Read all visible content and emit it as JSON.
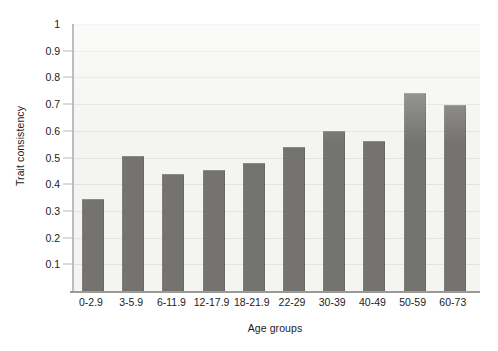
{
  "chart_data": {
    "type": "bar",
    "title": "",
    "xlabel": "Age groups",
    "ylabel": "Trait consistency",
    "categories": [
      "0-2.9",
      "3-5.9",
      "6-11.9",
      "12-17.9",
      "18-21.9",
      "22-29",
      "30-39",
      "40-49",
      "50-59",
      "60-73"
    ],
    "values": [
      0.345,
      0.505,
      0.44,
      0.455,
      0.48,
      0.54,
      0.6,
      0.56,
      0.74,
      0.695
    ],
    "ylim": [
      0,
      1
    ],
    "ytick_labels": [
      "0.1",
      "0.2",
      "0.3",
      "0.4",
      "0.5",
      "0.6",
      "0.7",
      "0.8",
      "0.9",
      "1"
    ],
    "ytick_values": [
      0.1,
      0.2,
      0.3,
      0.4,
      0.5,
      0.6,
      0.7,
      0.8,
      0.9,
      1
    ],
    "grid": true,
    "legend": null,
    "legend_position": "none",
    "series": [
      {
        "name": "Trait consistency",
        "values": [
          0.345,
          0.505,
          0.44,
          0.455,
          0.48,
          0.54,
          0.6,
          0.56,
          0.74,
          0.695
        ]
      }
    ],
    "colors": {
      "bar": "#74736f",
      "bar_edge": "#8b8a86",
      "plot_background": "#f4f4f2",
      "gridline": "#e2e2df",
      "axis_line": "#9a9a96",
      "text": "#1b1b1b",
      "figure_background": "#ffffff"
    }
  }
}
